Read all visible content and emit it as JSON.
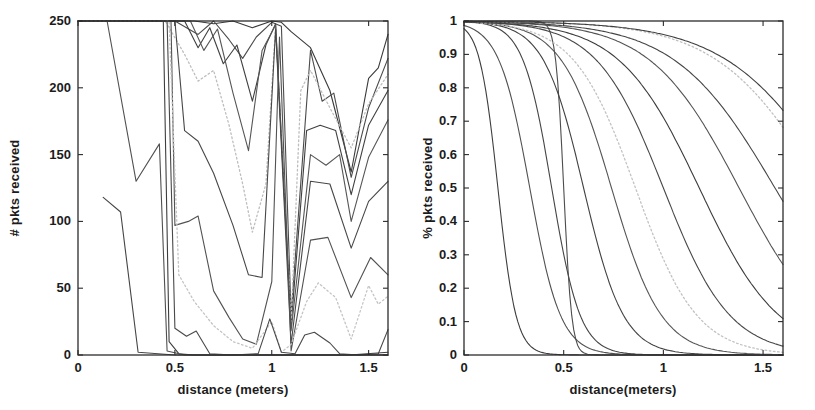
{
  "figure": {
    "background_color": "#ffffff",
    "axis_color": "#2b2b2b",
    "tick_label_color": "#1c1c1c",
    "dark_line_color": "#424242",
    "light_line_color": "#bdbdbd"
  },
  "chart_data": [
    {
      "type": "line",
      "title": "",
      "xlabel": "distance (meters)",
      "ylabel": "# pkts received",
      "xlim": [
        0,
        1.6
      ],
      "ylim": [
        0,
        250
      ],
      "xticks": [
        0,
        0.5,
        1,
        1.5
      ],
      "yticks": [
        0,
        50,
        100,
        150,
        200,
        250
      ],
      "grid": false,
      "legend": "none",
      "series": [
        {
          "name": "pkt-count-trace-01",
          "style": "solid",
          "color": "#3a3a3a",
          "points": [
            [
              0,
              250
            ],
            [
              0.45,
              250
            ],
            [
              0.6,
              250
            ],
            [
              0.7,
              248
            ],
            [
              0.8,
              250
            ],
            [
              0.9,
              245
            ],
            [
              1.0,
              250
            ],
            [
              1.05,
              249
            ],
            [
              1.1,
              242
            ],
            [
              1.2,
              230
            ],
            [
              1.3,
              198
            ],
            [
              1.41,
              137
            ],
            [
              1.5,
              207
            ],
            [
              1.55,
              215
            ],
            [
              1.6,
              240
            ]
          ]
        },
        {
          "name": "pkt-count-trace-02",
          "style": "solid",
          "color": "#4b4b4b",
          "points": [
            [
              0,
              250
            ],
            [
              0.5,
              250
            ],
            [
              0.62,
              240
            ],
            [
              0.7,
              250
            ],
            [
              0.78,
              236
            ],
            [
              0.85,
              222
            ],
            [
              0.92,
              238
            ],
            [
              1.0,
              249
            ],
            [
              1.05,
              246
            ],
            [
              1.1,
              30
            ],
            [
              1.2,
              228
            ],
            [
              1.26,
              190
            ],
            [
              1.32,
              196
            ],
            [
              1.41,
              133
            ],
            [
              1.5,
              185
            ],
            [
              1.6,
              222
            ]
          ]
        },
        {
          "name": "pkt-count-trace-03",
          "style": "solid",
          "color": "#404040",
          "points": [
            [
              0,
              250
            ],
            [
              0.55,
              250
            ],
            [
              0.62,
              230
            ],
            [
              0.68,
              245
            ],
            [
              0.75,
              218
            ],
            [
              0.82,
              232
            ],
            [
              0.9,
              190
            ],
            [
              0.97,
              232
            ],
            [
              1.02,
              248
            ],
            [
              1.1,
              22
            ],
            [
              1.18,
              168
            ],
            [
              1.25,
              172
            ],
            [
              1.33,
              168
            ],
            [
              1.41,
              120
            ],
            [
              1.5,
              172
            ],
            [
              1.6,
              198
            ]
          ]
        },
        {
          "name": "pkt-count-trace-04",
          "style": "dotted",
          "color": "#bdbdbd",
          "points": [
            [
              0,
              250
            ],
            [
              0.45,
              250
            ],
            [
              0.55,
              225
            ],
            [
              0.62,
              205
            ],
            [
              0.7,
              213
            ],
            [
              0.78,
              172
            ],
            [
              0.85,
              128
            ],
            [
              0.9,
              92
            ],
            [
              0.97,
              128
            ],
            [
              1.02,
              246
            ],
            [
              1.1,
              25
            ],
            [
              1.15,
              198
            ],
            [
              1.2,
              213
            ],
            [
              1.3,
              185
            ],
            [
              1.41,
              155
            ],
            [
              1.5,
              188
            ],
            [
              1.6,
              210
            ]
          ]
        },
        {
          "name": "pkt-count-trace-05",
          "style": "solid",
          "color": "#565656",
          "points": [
            [
              0,
              250
            ],
            [
              0.58,
              250
            ],
            [
              0.65,
              228
            ],
            [
              0.72,
              244
            ],
            [
              0.8,
              196
            ],
            [
              0.88,
              153
            ],
            [
              0.95,
              228
            ],
            [
              1.02,
              247
            ],
            [
              1.1,
              18
            ],
            [
              1.2,
              150
            ],
            [
              1.28,
              142
            ],
            [
              1.35,
              150
            ],
            [
              1.41,
              100
            ],
            [
              1.5,
              148
            ],
            [
              1.6,
              176
            ]
          ]
        },
        {
          "name": "pkt-count-trace-06",
          "style": "solid",
          "color": "#474747",
          "points": [
            [
              0,
              250
            ],
            [
              0.5,
              250
            ],
            [
              0.55,
              168
            ],
            [
              0.62,
              160
            ],
            [
              0.7,
              136
            ],
            [
              0.8,
              97
            ],
            [
              0.88,
              60
            ],
            [
              0.95,
              58
            ],
            [
              1.02,
              244
            ],
            [
              1.1,
              8
            ],
            [
              1.2,
              130
            ],
            [
              1.3,
              128
            ],
            [
              1.41,
              80
            ],
            [
              1.5,
              115
            ],
            [
              1.6,
              130
            ]
          ]
        },
        {
          "name": "pkt-count-trace-07",
          "style": "solid",
          "color": "#525252",
          "points": [
            [
              0,
              250
            ],
            [
              0.48,
              250
            ],
            [
              0.5,
              97
            ],
            [
              0.57,
              100
            ],
            [
              0.62,
              104
            ],
            [
              0.7,
              48
            ],
            [
              0.78,
              28
            ],
            [
              0.85,
              12
            ],
            [
              0.92,
              8
            ],
            [
              1.0,
              55
            ],
            [
              1.04,
              238
            ],
            [
              1.1,
              3
            ],
            [
              1.2,
              86
            ],
            [
              1.29,
              88
            ],
            [
              1.41,
              43
            ],
            [
              1.51,
              73
            ],
            [
              1.6,
              60
            ]
          ]
        },
        {
          "name": "pkt-count-trace-08",
          "style": "dotted",
          "color": "#c4c4c4",
          "points": [
            [
              0,
              250
            ],
            [
              0.47,
              250
            ],
            [
              0.52,
              60
            ],
            [
              0.6,
              40
            ],
            [
              0.7,
              22
            ],
            [
              0.8,
              10
            ],
            [
              0.9,
              5
            ],
            [
              1.0,
              25
            ],
            [
              1.05,
              2
            ],
            [
              1.1,
              8
            ],
            [
              1.18,
              40
            ],
            [
              1.24,
              54
            ],
            [
              1.33,
              43
            ],
            [
              1.41,
              12
            ],
            [
              1.5,
              52
            ],
            [
              1.55,
              38
            ],
            [
              1.6,
              44
            ]
          ]
        },
        {
          "name": "pkt-count-trace-09",
          "style": "solid",
          "color": "#494949",
          "points": [
            [
              0,
              250
            ],
            [
              0.46,
              250
            ],
            [
              0.5,
              20
            ],
            [
              0.56,
              14
            ],
            [
              0.61,
              18
            ],
            [
              0.68,
              1
            ],
            [
              0.8,
              0
            ],
            [
              0.93,
              1
            ],
            [
              0.99,
              27
            ],
            [
              1.05,
              2
            ],
            [
              1.12,
              1
            ],
            [
              1.17,
              15
            ],
            [
              1.22,
              17
            ],
            [
              1.3,
              9
            ],
            [
              1.35,
              1
            ],
            [
              1.45,
              0
            ],
            [
              1.55,
              1
            ],
            [
              1.6,
              19
            ]
          ]
        },
        {
          "name": "pkt-count-trace-10",
          "style": "solid",
          "color": "#3e3e3e",
          "points": [
            [
              0,
              250
            ],
            [
              0.44,
              250
            ],
            [
              0.47,
              10
            ],
            [
              0.52,
              1
            ],
            [
              0.6,
              0
            ],
            [
              0.8,
              0
            ],
            [
              1.0,
              0
            ],
            [
              1.2,
              0
            ],
            [
              1.4,
              0
            ],
            [
              1.6,
              2
            ]
          ]
        },
        {
          "name": "pkt-count-trace-11",
          "style": "solid",
          "color": "#505050",
          "points": [
            [
              0.15,
              250
            ],
            [
              0.3,
              130
            ],
            [
              0.42,
              158
            ],
            [
              0.46,
              3
            ],
            [
              0.55,
              0
            ],
            [
              0.7,
              0
            ],
            [
              0.9,
              0
            ],
            [
              1.1,
              0
            ],
            [
              1.3,
              0
            ],
            [
              1.5,
              0
            ],
            [
              1.6,
              0
            ]
          ]
        },
        {
          "name": "pkt-count-trace-12",
          "style": "solid",
          "color": "#454545",
          "points": [
            [
              0.13,
              118
            ],
            [
              0.22,
              107
            ],
            [
              0.31,
              2
            ],
            [
              0.5,
              0
            ],
            [
              0.7,
              0
            ],
            [
              0.9,
              0
            ],
            [
              1.1,
              0
            ],
            [
              1.3,
              0
            ],
            [
              1.5,
              0
            ],
            [
              1.6,
              0
            ]
          ]
        }
      ]
    },
    {
      "type": "line",
      "title": "",
      "xlabel": "distance(meters)",
      "ylabel": "% pkts received",
      "xlim": [
        0,
        1.6
      ],
      "ylim": [
        0,
        1
      ],
      "xticks": [
        0,
        0.5,
        1,
        1.5
      ],
      "yticks": [
        0,
        0.1,
        0.2,
        0.3,
        0.4,
        0.5,
        0.6,
        0.7,
        0.8,
        0.9,
        1
      ],
      "grid": false,
      "legend": "none",
      "curve_model": "logistic: y = 1 / (1 + exp(k*(x - m)))",
      "series": [
        {
          "name": "psr-fit-curve-01",
          "style": "solid",
          "color": "#3e3e3e",
          "midpoint": 0.17,
          "steepness": 22
        },
        {
          "name": "psr-fit-curve-02",
          "style": "solid",
          "color": "#515151",
          "midpoint": 0.33,
          "steepness": 13
        },
        {
          "name": "psr-fit-curve-03",
          "style": "solid",
          "color": "#454545",
          "midpoint": 0.44,
          "steepness": 14
        },
        {
          "name": "psr-fit-curve-04",
          "style": "solid",
          "color": "#4c4c4c",
          "midpoint": 0.5,
          "steepness": 50
        },
        {
          "name": "psr-fit-curve-05",
          "style": "solid",
          "color": "#414141",
          "midpoint": 0.6,
          "steepness": 10
        },
        {
          "name": "psr-fit-curve-06",
          "style": "solid",
          "color": "#555555",
          "midpoint": 0.74,
          "steepness": 8
        },
        {
          "name": "psr-fit-curve-07",
          "style": "dotted",
          "color": "#c2c2c2",
          "midpoint": 0.86,
          "steepness": 6.5
        },
        {
          "name": "psr-fit-curve-08",
          "style": "solid",
          "color": "#484848",
          "midpoint": 1.0,
          "steepness": 6
        },
        {
          "name": "psr-fit-curve-09",
          "style": "solid",
          "color": "#3c3c3c",
          "midpoint": 1.18,
          "steepness": 5
        },
        {
          "name": "psr-fit-curve-10",
          "style": "solid",
          "color": "#535353",
          "midpoint": 1.38,
          "steepness": 4.5
        },
        {
          "name": "psr-fit-curve-11",
          "style": "solid",
          "color": "#464646",
          "midpoint": 1.56,
          "steepness": 4
        },
        {
          "name": "psr-fit-curve-12",
          "style": "dotted",
          "color": "#bfbfbf",
          "midpoint": 1.8,
          "steepness": 3.8
        },
        {
          "name": "psr-fit-curve-13",
          "style": "solid",
          "color": "#3f3f3f",
          "midpoint": 1.88,
          "steepness": 3.6
        }
      ]
    }
  ]
}
